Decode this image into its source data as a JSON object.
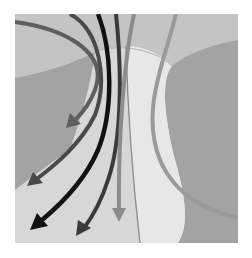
{
  "figure": {
    "colors": {
      "background": "#ffffff",
      "top_band": "#c4c4c4",
      "side_blob": "#a3a3a3",
      "vase_left": "#d7d7d7",
      "vase_right": "#e7e7e7",
      "divider": "#8a8a8a",
      "arrow_black": "#111111",
      "arrow_dark": "#3a3a3a",
      "arrow_mid": "#5e5e5e",
      "arrow_gray": "#8c8c8c",
      "arrow_light": "#9a9a9a"
    },
    "arrows": [
      {
        "id": "arrow-outer-left",
        "tone": "arrow_mid"
      },
      {
        "id": "arrow-second-left",
        "tone": "arrow_dark"
      },
      {
        "id": "arrow-black",
        "tone": "arrow_black"
      },
      {
        "id": "arrow-dark-center",
        "tone": "arrow_dark"
      },
      {
        "id": "arrow-gray-straight",
        "tone": "arrow_gray"
      },
      {
        "id": "curve-right",
        "tone": "arrow_light"
      }
    ]
  }
}
